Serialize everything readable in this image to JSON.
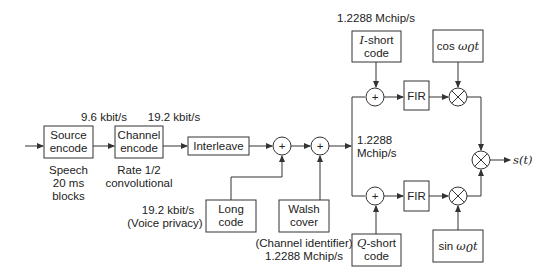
{
  "diagram": {
    "blocks": {
      "source_encode": [
        "Source",
        "encode"
      ],
      "channel_encode": [
        "Channel",
        "encode"
      ],
      "interleave": "Interleave",
      "long_code": [
        "Long",
        "code"
      ],
      "walsh_cover": [
        "Walsh",
        "cover"
      ],
      "i_short_code": [
        "I",
        "-short",
        "code"
      ],
      "q_short_code": [
        "Q",
        "-short",
        "code"
      ],
      "fir_upper": "FIR",
      "fir_lower": "FIR",
      "cos": [
        "cos ",
        "ω",
        "0",
        "t"
      ],
      "sin": [
        "sin ",
        "ω",
        "0",
        "t"
      ]
    },
    "labels": {
      "rate_source": "9.6 kbit/s",
      "rate_channel": "19.2 kbit/s",
      "source_note": [
        "Speech",
        "20 ms",
        "blocks"
      ],
      "channel_note": [
        "Rate 1/2",
        "convolutional"
      ],
      "long_code_rate": [
        "19.2 kbit/s",
        "(Voice privacy)"
      ],
      "walsh_note": [
        "(Channel identifier)",
        "1.2288 Mchip/s"
      ],
      "top_rate": "1.2288 Mchip/s",
      "mid_rate": [
        "1.2288",
        "Mchip/s"
      ],
      "output": [
        "s(",
        "t",
        ")"
      ]
    },
    "symbols": {
      "adder": "+",
      "multiplier": "⊗"
    }
  }
}
